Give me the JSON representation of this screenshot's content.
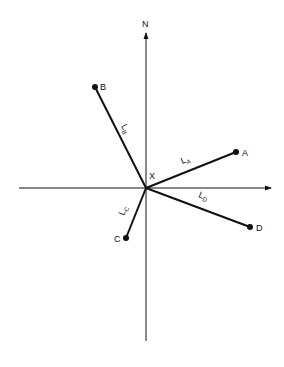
{
  "diagram": {
    "axis_north_label": "N",
    "origin_label": "X",
    "points": [
      {
        "name": "A",
        "x": 236,
        "y": 152
      },
      {
        "name": "B",
        "x": 95,
        "y": 87
      },
      {
        "name": "C",
        "x": 126,
        "y": 238
      },
      {
        "name": "D",
        "x": 250,
        "y": 227
      }
    ],
    "segments": [
      {
        "label": "L",
        "sub": "A",
        "to": "A"
      },
      {
        "label": "L",
        "sub": "B",
        "to": "B"
      },
      {
        "label": "L",
        "sub": "C",
        "to": "C"
      },
      {
        "label": "L",
        "sub": "D",
        "to": "D"
      }
    ],
    "labels": {
      "A": "A",
      "B": "B",
      "C": "C",
      "D": "D",
      "LA_main": "L",
      "LA_sub": "A",
      "LB_main": "L",
      "LB_sub": "B",
      "LC_main": "L",
      "LC_sub": "C",
      "LD_main": "L",
      "LD_sub": "D"
    },
    "line_color": "#111111"
  }
}
